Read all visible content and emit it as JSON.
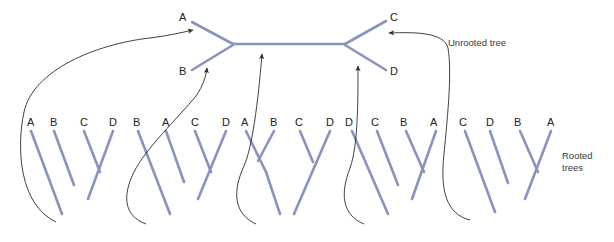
{
  "figure": {
    "branch_color": "#8a93bf",
    "arrow_color": "#2b2b2b",
    "label_color": "#222222",
    "background": "#ffffff"
  },
  "annotations": {
    "unrooted_label": "Unrooted tree",
    "rooted_label_line1": "Rooted",
    "rooted_label_line2": "trees"
  },
  "unrooted_tree": {
    "name": "unrooted-tree",
    "tips": [
      {
        "label": "A",
        "x": 181,
        "y": 18
      },
      {
        "label": "B",
        "x": 181,
        "y": 73
      },
      {
        "label": "C",
        "x": 392,
        "y": 18
      },
      {
        "label": "D",
        "x": 392,
        "y": 73
      }
    ],
    "branch_targets": [
      "A",
      "B",
      "internal",
      "D",
      "C"
    ]
  },
  "rooted_trees": [
    {
      "name": "rooted-tree-1",
      "order": [
        "A",
        "B",
        "C",
        "D"
      ],
      "shape": "ladder-left",
      "root_x": 62
    },
    {
      "name": "rooted-tree-2",
      "order": [
        "B",
        "A",
        "C",
        "D"
      ],
      "shape": "ladder-left",
      "root_x": 170
    },
    {
      "name": "rooted-tree-3",
      "order": [
        "A",
        "B",
        "C",
        "D"
      ],
      "shape": "balanced",
      "root_x": 280
    },
    {
      "name": "rooted-tree-4",
      "order": [
        "D",
        "C",
        "B",
        "A"
      ],
      "shape": "ladder-right",
      "root_x": 388
    },
    {
      "name": "rooted-tree-5",
      "order": [
        "C",
        "D",
        "B",
        "A"
      ],
      "shape": "ladder-right",
      "root_x": 495
    }
  ],
  "tip_labels": {
    "tree1": [
      {
        "text": "A",
        "x": 27,
        "y": 117
      },
      {
        "text": "B",
        "x": 50,
        "y": 117
      },
      {
        "text": "C",
        "x": 80,
        "y": 117
      },
      {
        "text": "D",
        "x": 109,
        "y": 117
      }
    ],
    "tree2": [
      {
        "text": "B",
        "x": 133,
        "y": 117
      },
      {
        "text": "A",
        "x": 162,
        "y": 117
      },
      {
        "text": "C",
        "x": 191,
        "y": 117
      },
      {
        "text": "D",
        "x": 222,
        "y": 117
      }
    ],
    "tree3": [
      {
        "text": "A",
        "x": 241,
        "y": 117
      },
      {
        "text": "B",
        "x": 270,
        "y": 117
      },
      {
        "text": "C",
        "x": 295,
        "y": 117
      },
      {
        "text": "D",
        "x": 326,
        "y": 117
      }
    ],
    "tree4": [
      {
        "text": "D",
        "x": 345,
        "y": 117
      },
      {
        "text": "C",
        "x": 371,
        "y": 117
      },
      {
        "text": "B",
        "x": 400,
        "y": 117
      },
      {
        "text": "A",
        "x": 430,
        "y": 117
      }
    ],
    "tree5": [
      {
        "text": "C",
        "x": 459,
        "y": 117
      },
      {
        "text": "D",
        "x": 486,
        "y": 117
      },
      {
        "text": "B",
        "x": 514,
        "y": 117
      },
      {
        "text": "A",
        "x": 547,
        "y": 117
      }
    ]
  },
  "mapping_arrows": [
    {
      "name": "arrow-branch-A-to-tree1",
      "from_branch": "A",
      "to_tree": "rooted-tree-1"
    },
    {
      "name": "arrow-branch-B-to-tree2",
      "from_branch": "B",
      "to_tree": "rooted-tree-2"
    },
    {
      "name": "arrow-branch-internal-to-tree3",
      "from_branch": "internal",
      "to_tree": "rooted-tree-3"
    },
    {
      "name": "arrow-branch-D-to-tree4",
      "from_branch": "D",
      "to_tree": "rooted-tree-4"
    },
    {
      "name": "arrow-branch-C-to-tree5",
      "from_branch": "C",
      "to_tree": "rooted-tree-5"
    }
  ]
}
